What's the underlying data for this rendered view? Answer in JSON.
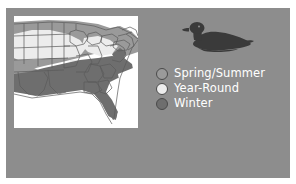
{
  "figure": {
    "panel_color": "#8d8d8d",
    "background_color": "#ffffff"
  },
  "bird": {
    "icon": "duck-silhouette-icon",
    "color": "#3a3a3a"
  },
  "map": {
    "icon": "us-range-map",
    "background_color": "#ffffff",
    "outline_color": "#5a5a5a",
    "region_colors": {
      "spring_summer": "#9a9a9a",
      "year_round": "#e8e8e8",
      "winter": "#6e6e6e"
    }
  },
  "legend": {
    "items": [
      {
        "label": "Spring/Summer",
        "color": "#9a9a9a",
        "border": "#4a4a4a"
      },
      {
        "label": "Year-Round",
        "color": "#ececec",
        "border": "#4a4a4a"
      },
      {
        "label": "Winter",
        "color": "#6e6e6e",
        "border": "#4a4a4a"
      }
    ]
  }
}
